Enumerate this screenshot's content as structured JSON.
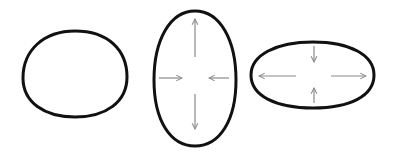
{
  "diagram": {
    "colors": {
      "background": "#ffffff",
      "outline": "#111111",
      "arrow": "#8a8a8a"
    },
    "shapes": [
      {
        "id": "circle",
        "label": "undeformed",
        "cx": 75,
        "cy": 74,
        "rx": 52,
        "ry": 43
      },
      {
        "id": "vertical-ellipse",
        "label": "vertically stretched",
        "cx": 195,
        "cy": 78,
        "rx": 41,
        "ry": 67
      },
      {
        "id": "horizontal-ellipse",
        "label": "horizontally stretched",
        "cx": 313,
        "cy": 75,
        "rx": 61,
        "ry": 33
      }
    ]
  }
}
